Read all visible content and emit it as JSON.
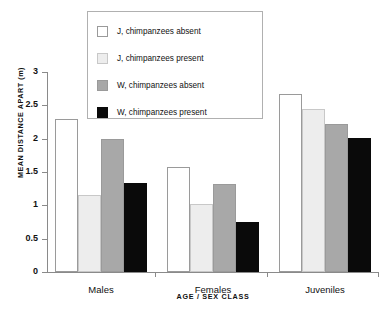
{
  "chart_data": {
    "type": "bar",
    "title": "",
    "xlabel": "AGE / SEX CLASS",
    "ylabel": "MEAN DISTANCE APART (m)",
    "categories": [
      "Males",
      "Females",
      "Juveniles"
    ],
    "series": [
      {
        "name": "J, chimpanzees absent",
        "color": "#ffffff",
        "values": [
          2.29,
          1.58,
          2.67
        ]
      },
      {
        "name": "J, chimpanzees present",
        "color": "#ededed",
        "values": [
          1.15,
          1.02,
          2.45
        ]
      },
      {
        "name": "W, chimpanzees absent",
        "color": "#a8a8a8",
        "values": [
          2.0,
          1.32,
          2.22
        ]
      },
      {
        "name": "W, chimpanzees present",
        "color": "#0a0a0a",
        "values": [
          1.34,
          0.75,
          2.01
        ]
      }
    ],
    "ylim": [
      0,
      3
    ],
    "yticks": [
      0,
      0.5,
      1,
      1.5,
      2,
      2.5,
      3
    ],
    "ytick_labels": [
      "0",
      "0.5",
      "1",
      "1.5",
      "2",
      "2.5",
      "3"
    ],
    "grid": false,
    "legend_position": "top-center"
  }
}
